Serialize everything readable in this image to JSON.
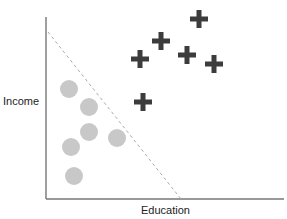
{
  "chart_data": {
    "type": "scatter",
    "title": "",
    "xlabel": "Education",
    "ylabel": "Income",
    "grid": false,
    "legend": "none",
    "axis_ticks": false,
    "series": [
      {
        "name": "circle-class",
        "marker": "circle",
        "color": "#c8c8c8",
        "points": [
          {
            "x": 69,
            "y": 89
          },
          {
            "x": 89,
            "y": 107
          },
          {
            "x": 89,
            "y": 132
          },
          {
            "x": 117,
            "y": 138
          },
          {
            "x": 71,
            "y": 147
          },
          {
            "x": 74,
            "y": 176
          }
        ]
      },
      {
        "name": "plus-class",
        "marker": "plus",
        "color": "#3c3c3c",
        "points": [
          {
            "x": 140,
            "y": 59
          },
          {
            "x": 161,
            "y": 41
          },
          {
            "x": 199,
            "y": 19
          },
          {
            "x": 187,
            "y": 55
          },
          {
            "x": 214,
            "y": 64
          },
          {
            "x": 143,
            "y": 102
          }
        ]
      }
    ],
    "decision_boundary": {
      "style": "dashed",
      "color": "#aaaaaa",
      "from": {
        "x": 48,
        "y": 32
      },
      "to": {
        "x": 181,
        "y": 199
      }
    },
    "axes": {
      "origin": {
        "x": 46,
        "y": 199
      },
      "y_top": 17,
      "x_right": 284,
      "color": "#777777"
    }
  }
}
